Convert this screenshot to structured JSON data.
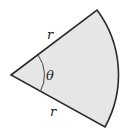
{
  "diagram": {
    "type": "circular-sector",
    "labels": {
      "radius_top": "r",
      "radius_bottom": "r",
      "angle": "θ"
    },
    "colors": {
      "fill": "#e6e6e6",
      "stroke": "#2a2a2a",
      "background": "#ffffff"
    }
  }
}
